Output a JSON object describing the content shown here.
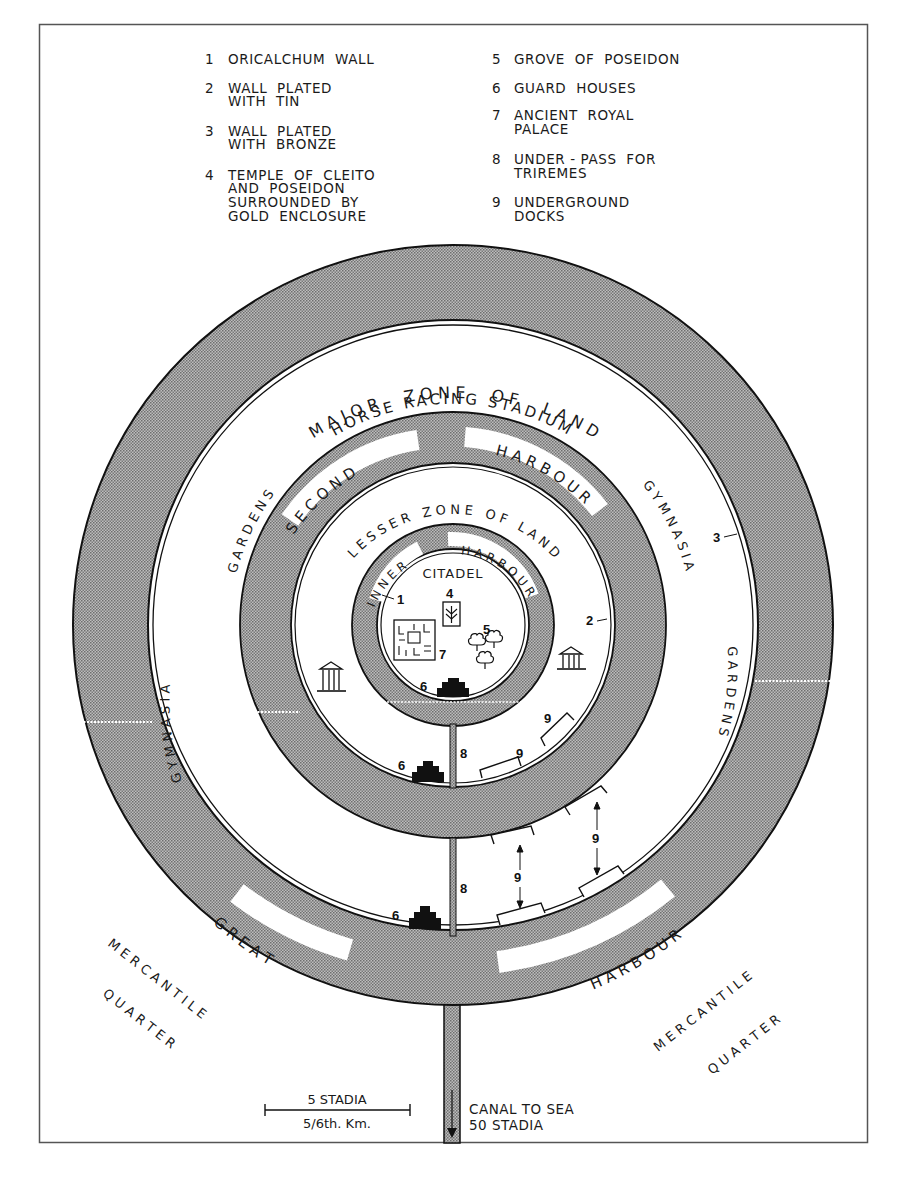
{
  "legend": {
    "left": [
      {
        "num": "1",
        "lines": [
          "ORICALCHUM  WALL"
        ]
      },
      {
        "num": "2",
        "lines": [
          "WALL  PLATED",
          "WITH  TIN"
        ]
      },
      {
        "num": "3",
        "lines": [
          "WALL  PLATED",
          "WITH  BRONZE"
        ]
      },
      {
        "num": "4",
        "lines": [
          "TEMPLE  OF  CLEITO",
          "AND  POSEIDON",
          "SURROUNDED  BY",
          "GOLD  ENCLOSURE"
        ]
      }
    ],
    "right": [
      {
        "num": "5",
        "lines": [
          "GROVE  OF  POSEIDON"
        ]
      },
      {
        "num": "6",
        "lines": [
          "GUARD  HOUSES"
        ]
      },
      {
        "num": "7",
        "lines": [
          "ANCIENT  ROYAL",
          "PALACE"
        ]
      },
      {
        "num": "8",
        "lines": [
          "UNDER - PASS  FOR",
          "TRIREMES"
        ]
      },
      {
        "num": "9",
        "lines": [
          "UNDERGROUND",
          "DOCKS"
        ]
      }
    ]
  },
  "zones": {
    "major_zone": "M A J O R     Z O N E     O F     L A N D",
    "horse_racing": "HORSE RACING STADIUM",
    "second_harbour_a": "S E C O N D",
    "second_harbour_b": "H A R B O U R",
    "lesser_zone": "L E S S E R   Z O N E   O F   L A N D",
    "inner_a": "I N N E R",
    "inner_b": "H A R B O U R",
    "citadel": "CITADEL",
    "gardens_left": "G A R D E N S",
    "gardens_right": "G A R D E N S",
    "gymnasia_left": "G Y M N A S I A",
    "gymnasia_right": "G Y M N A S I A",
    "great_a": "G R E A T",
    "great_b": "H A R B O U R"
  },
  "quarters": {
    "left_1": "M E R C A N T I L E",
    "left_2": "Q U A R T E R",
    "right_1": "M E R C A N T I L E",
    "right_2": "Q U A R T E R"
  },
  "markers": {
    "m1": "1",
    "m2": "2",
    "m3": "3",
    "m4": "4",
    "m5": "5",
    "m6a": "6",
    "m6b": "6",
    "m6c": "6",
    "m7": "7",
    "m8a": "8",
    "m8b": "8",
    "m9a": "9",
    "m9b": "9",
    "m9c": "9",
    "m9d": "9"
  },
  "scale": {
    "top": "5 STADIA",
    "bottom": "5/6th. Km."
  },
  "canal": {
    "line1": "CANAL TO SEA",
    "line2": "50 STADIA"
  },
  "colors": {
    "ink": "#1a1a1a",
    "stipple": "#9a9a9a",
    "paper": "#ffffff",
    "frame": "#555555"
  }
}
